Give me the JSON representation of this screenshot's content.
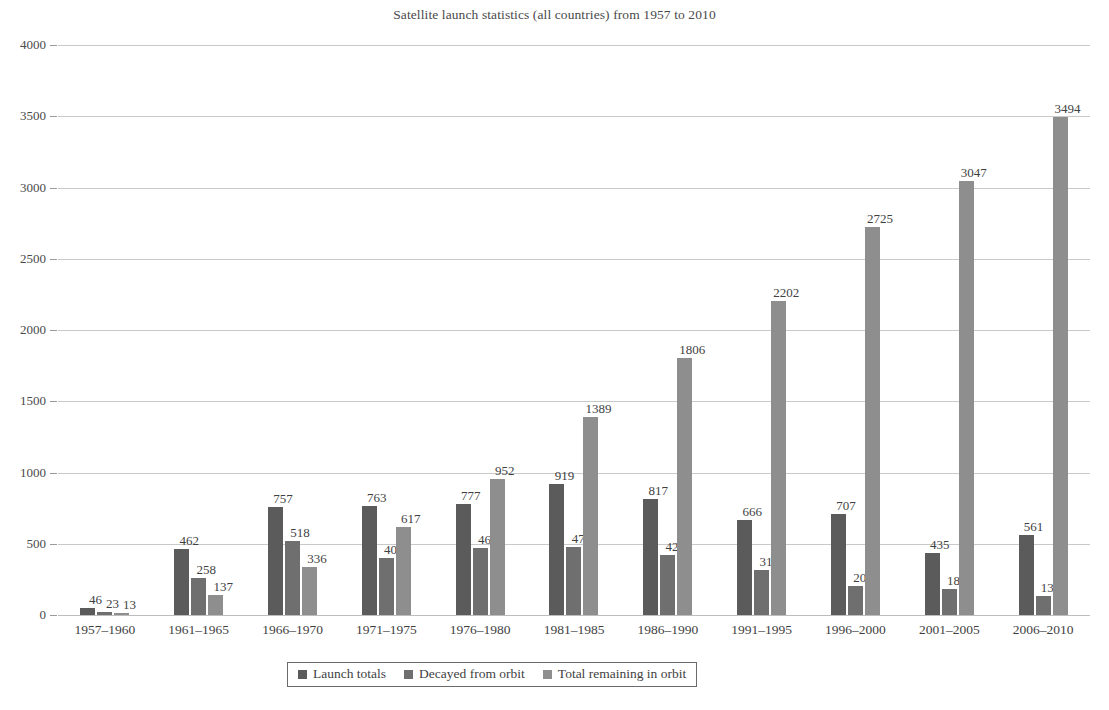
{
  "chart_data": {
    "type": "bar",
    "title": "Satellite launch statistics (all countries) from 1957 to 2010",
    "xlabel": "",
    "ylabel": "",
    "ylim": [
      0,
      4000
    ],
    "ytick_step": 500,
    "yticks": [
      "0",
      "500",
      "1000",
      "1500",
      "2000",
      "2500",
      "3000",
      "3500",
      "4000"
    ],
    "grid": true,
    "legend_position": "bottom",
    "categories": [
      "1957–1960",
      "1961–1965",
      "1966–1970",
      "1971–1975",
      "1976–1980",
      "1981–1985",
      "1986–1990",
      "1991–1995",
      "1996–2000",
      "2001–2005",
      "2006–2010"
    ],
    "series": [
      {
        "name": "Launch totals",
        "color": "#5b5b5b",
        "values": [
          46,
          462,
          757,
          763,
          777,
          919,
          817,
          666,
          707,
          435,
          561
        ]
      },
      {
        "name": "Decayed from orbit",
        "color": "#6f6f6f",
        "values": [
          23,
          258,
          518,
          400,
          468,
          474,
          423,
          313,
          202,
          180,
          136
        ]
      },
      {
        "name": "Total remaining in orbit",
        "color": "#8e8e8e",
        "values": [
          13,
          137,
          336,
          617,
          952,
          1389,
          1806,
          2202,
          2725,
          3047,
          3494
        ]
      }
    ]
  }
}
